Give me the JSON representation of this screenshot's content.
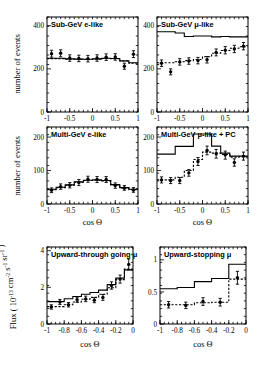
{
  "figure": {
    "xlabel": "cos Θ",
    "ylabel_events": "number of events",
    "ylabel_flux": "Flux ( 10",
    "ylabel_flux_exp": "-13",
    "ylabel_flux_mid": " cm",
    "ylabel_flux_exp2": "-2",
    "ylabel_flux_mid2": " s",
    "ylabel_flux_exp3": "-1",
    "ylabel_flux_mid3": " sr",
    "ylabel_flux_exp4": "-1",
    "ylabel_flux_end": " )"
  },
  "chart_data": [
    {
      "id": "sub-gev-e-like",
      "type": "line",
      "title": "Sub-GeV e-like",
      "xlabel": "cos Θ",
      "ylabel": "number of events",
      "xlim": [
        -1,
        1
      ],
      "ylim": [
        0,
        440
      ],
      "xticks": [
        -1,
        -0.5,
        0,
        0.5,
        1
      ],
      "xticklabels": [
        "-1",
        "-0.5",
        "0",
        "0.5",
        "1"
      ],
      "yticks": [
        0,
        200,
        400
      ],
      "yticklabels": [
        "0",
        "200",
        "400"
      ],
      "grid": false,
      "legend": "none",
      "bin_edges": [
        -1,
        -0.8,
        -0.6,
        -0.4,
        -0.2,
        0,
        0.2,
        0.4,
        0.6,
        0.8,
        1
      ],
      "x": [
        -0.9,
        -0.7,
        -0.5,
        -0.3,
        -0.1,
        0.1,
        0.3,
        0.5,
        0.7,
        0.9
      ],
      "series": [
        {
          "name": "data",
          "style": "points",
          "values": [
            270,
            272,
            250,
            248,
            247,
            250,
            254,
            255,
            212,
            268
          ],
          "errors": [
            16,
            16,
            15,
            15,
            15,
            15,
            15,
            15,
            14,
            16
          ]
        },
        {
          "name": "MC no oscillation",
          "style": "solid-histogram",
          "values": [
            249,
            249,
            246,
            245,
            244,
            246,
            249,
            248,
            237,
            228
          ]
        },
        {
          "name": "MC best-fit oscillation",
          "style": "dashed-histogram",
          "values": [
            247,
            247,
            245,
            244,
            243,
            245,
            248,
            247,
            236,
            226
          ]
        }
      ]
    },
    {
      "id": "sub-gev-mu-like",
      "type": "line",
      "title": "Sub-GeV μ-like",
      "xlabel": "cos Θ",
      "ylabel": "number of events",
      "xlim": [
        -1,
        1
      ],
      "ylim": [
        0,
        440
      ],
      "xticks": [
        -1,
        -0.5,
        0,
        0.5,
        1
      ],
      "xticklabels": [
        "-1",
        "-0.5",
        "0",
        "0.5",
        "1"
      ],
      "yticks": [
        0,
        200,
        400
      ],
      "yticklabels": [
        "0",
        "200",
        "400"
      ],
      "grid": false,
      "legend": "none",
      "bin_edges": [
        -1,
        -0.8,
        -0.6,
        -0.4,
        -0.2,
        0,
        0.2,
        0.4,
        0.6,
        0.8,
        1
      ],
      "x": [
        -0.9,
        -0.7,
        -0.5,
        -0.3,
        -0.1,
        0.1,
        0.3,
        0.5,
        0.7,
        0.9
      ],
      "series": [
        {
          "name": "data",
          "style": "points",
          "values": [
            226,
            186,
            232,
            236,
            238,
            242,
            276,
            286,
            292,
            305
          ],
          "errors": [
            15,
            14,
            15,
            15,
            15,
            15,
            16,
            17,
            17,
            17
          ]
        },
        {
          "name": "MC no oscillation",
          "style": "solid-histogram",
          "values": [
            372,
            372,
            366,
            350,
            352,
            352,
            348,
            350,
            348,
            348
          ]
        },
        {
          "name": "MC best-fit oscillation",
          "style": "dashed-histogram",
          "values": [
            228,
            228,
            233,
            238,
            243,
            256,
            272,
            285,
            295,
            302
          ]
        }
      ]
    },
    {
      "id": "multi-gev-e-like",
      "type": "line",
      "title": "Multi-GeV e-like",
      "xlabel": "cos Θ",
      "ylabel": "number of events",
      "xlim": [
        -1,
        1
      ],
      "ylim": [
        0,
        230
      ],
      "xticks": [
        -1,
        -0.5,
        0,
        0.5,
        1
      ],
      "xticklabels": [
        "-1",
        "-0.5",
        "0",
        "0.5",
        "1"
      ],
      "yticks": [
        0,
        100,
        200
      ],
      "yticklabels": [
        "0",
        "100",
        "200"
      ],
      "grid": false,
      "legend": "none",
      "bin_edges": [
        -1,
        -0.8,
        -0.6,
        -0.4,
        -0.2,
        0,
        0.2,
        0.4,
        0.6,
        0.8,
        1
      ],
      "x": [
        -0.9,
        -0.7,
        -0.5,
        -0.3,
        -0.1,
        0.1,
        0.3,
        0.5,
        0.7,
        0.9
      ],
      "series": [
        {
          "name": "data",
          "style": "points",
          "values": [
            41,
            52,
            56,
            64,
            74,
            73,
            73,
            55,
            48,
            42
          ],
          "errors": [
            7,
            8,
            8,
            9,
            9,
            9,
            9,
            8,
            7,
            7
          ]
        },
        {
          "name": "MC no oscillation",
          "style": "solid-histogram",
          "values": [
            44,
            50,
            57,
            66,
            71,
            72,
            70,
            58,
            49,
            44
          ]
        },
        {
          "name": "MC best-fit oscillation",
          "style": "dashed-histogram",
          "values": [
            43,
            49,
            56,
            65,
            70,
            71,
            69,
            57,
            48,
            43
          ]
        }
      ]
    },
    {
      "id": "multi-gev-mu-like-pc",
      "type": "line",
      "title": "Multi-GeV μ-like + PC",
      "xlabel": "cos Θ",
      "ylabel": "number of events",
      "xlim": [
        -1,
        1
      ],
      "ylim": [
        0,
        230
      ],
      "xticks": [
        -1,
        -0.5,
        0,
        0.5,
        1
      ],
      "xticklabels": [
        "-1",
        "-0.5",
        "0",
        "0.5",
        "1"
      ],
      "yticks": [
        0,
        100,
        200
      ],
      "yticklabels": [
        "0",
        "100",
        "200"
      ],
      "grid": false,
      "legend": "none",
      "bin_edges": [
        -1,
        -0.8,
        -0.6,
        -0.4,
        -0.2,
        0,
        0.2,
        0.4,
        0.6,
        0.8,
        1
      ],
      "x": [
        -0.9,
        -0.7,
        -0.5,
        -0.3,
        -0.1,
        0.1,
        0.3,
        0.5,
        0.7,
        0.9
      ],
      "series": [
        {
          "name": "data",
          "style": "points",
          "values": [
            72,
            70,
            70,
            93,
            127,
            160,
            150,
            146,
            124,
            143
          ],
          "errors": [
            9,
            9,
            9,
            10,
            12,
            13,
            13,
            12,
            11,
            12
          ]
        },
        {
          "name": "MC no oscillation",
          "style": "solid-histogram",
          "values": [
            149,
            149,
            172,
            172,
            209,
            209,
            173,
            152,
            143,
            143
          ]
        },
        {
          "name": "MC best-fit oscillation",
          "style": "dashed-histogram",
          "values": [
            72,
            72,
            80,
            100,
            133,
            155,
            152,
            148,
            140,
            141
          ]
        }
      ]
    },
    {
      "id": "upward-through-going-mu",
      "type": "line",
      "title": "Upward-through going μ",
      "xlabel": "cos Θ",
      "ylabel": "Flux ( 10^-13 cm^-2 s^-1 sr^-1 )",
      "xlim": [
        -1,
        0
      ],
      "ylim": [
        0,
        4.2
      ],
      "xticks": [
        -1,
        -0.8,
        -0.6,
        -0.4,
        -0.2,
        0
      ],
      "xticklabels": [
        "-1",
        "-0.8",
        "-0.6",
        "-0.4",
        "-0.2",
        "0"
      ],
      "yticks": [
        0,
        2,
        4
      ],
      "yticklabels": [
        "0",
        "2",
        "4"
      ],
      "grid": false,
      "legend": "none",
      "bin_edges": [
        -1,
        -0.9,
        -0.8,
        -0.7,
        -0.6,
        -0.5,
        -0.4,
        -0.3,
        -0.2,
        -0.1,
        0
      ],
      "x": [
        -0.95,
        -0.85,
        -0.75,
        -0.65,
        -0.55,
        -0.45,
        -0.35,
        -0.25,
        -0.15,
        -0.05
      ],
      "series": [
        {
          "name": "data",
          "style": "points",
          "values": [
            0.93,
            1.2,
            1.05,
            1.32,
            1.37,
            1.3,
            1.45,
            2.1,
            2.45,
            3.25
          ],
          "errors": [
            0.12,
            0.14,
            0.12,
            0.14,
            0.15,
            0.14,
            0.16,
            0.2,
            0.22,
            0.3
          ]
        },
        {
          "name": "MC no oscillation",
          "style": "solid-histogram",
          "values": [
            1.22,
            1.22,
            1.38,
            1.5,
            1.62,
            1.72,
            1.85,
            2.15,
            2.5,
            2.95
          ]
        },
        {
          "name": "MC best-fit oscillation",
          "style": "dashed-histogram",
          "values": [
            0.95,
            0.95,
            1.05,
            1.2,
            1.35,
            1.45,
            1.62,
            1.98,
            2.42,
            3.0
          ]
        }
      ]
    },
    {
      "id": "upward-stopping-mu",
      "type": "line",
      "title": "Upward-stopping μ",
      "xlabel": "cos Θ",
      "ylabel": "Flux ( 10^-13 cm^-2 s^-1 sr^-1 )",
      "xlim": [
        -1,
        0
      ],
      "ylim": [
        0,
        1.2
      ],
      "xticks": [
        -1,
        -0.8,
        -0.6,
        -0.4,
        -0.2,
        0
      ],
      "xticklabels": [
        "-1",
        "-0.8",
        "-0.6",
        "-0.4",
        "-0.2",
        "0"
      ],
      "yticks": [
        0,
        0.5,
        1
      ],
      "yticklabels": [
        "0",
        "0.5",
        "1"
      ],
      "grid": false,
      "legend": "none",
      "bin_edges": [
        -1,
        -0.8,
        -0.6,
        -0.4,
        -0.2,
        0
      ],
      "x": [
        -0.9,
        -0.7,
        -0.5,
        -0.3,
        -0.1
      ],
      "series": [
        {
          "name": "data",
          "style": "points",
          "values": [
            0.3,
            0.29,
            0.35,
            0.34,
            0.72
          ],
          "errors": [
            0.05,
            0.05,
            0.06,
            0.06,
            0.1
          ]
        },
        {
          "name": "MC no oscillation",
          "style": "solid-histogram",
          "values": [
            0.55,
            0.57,
            0.66,
            0.71,
            0.93
          ]
        },
        {
          "name": "MC best-fit oscillation",
          "style": "dashed-histogram",
          "values": [
            0.3,
            0.3,
            0.33,
            0.34,
            0.7
          ]
        }
      ]
    }
  ]
}
